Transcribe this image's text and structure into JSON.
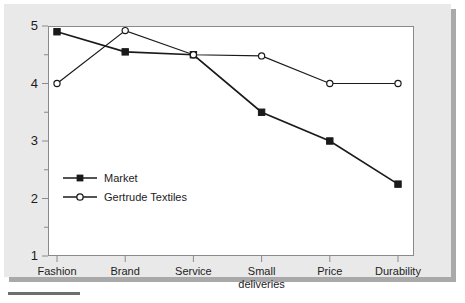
{
  "chart_data": {
    "type": "line",
    "title": "",
    "subtitle": "",
    "xlabel": "",
    "ylabel": "",
    "categories": [
      "Fashion",
      "Brand",
      "Service",
      "Small\ndeliveries",
      "Price",
      "Durability"
    ],
    "category_labels_flat": [
      "Fashion",
      "Brand",
      "Service",
      "Small deliveries",
      "Price",
      "Durability"
    ],
    "ylim": [
      1,
      5
    ],
    "ytick_labels": [
      "1",
      "2",
      "3",
      "4",
      "5"
    ],
    "ytick_values": [
      1,
      2,
      3,
      4,
      5
    ],
    "yminor_ticks": [
      1.5,
      2.5,
      3.5,
      4.5
    ],
    "grid": false,
    "legend_position": "inside-lower-left",
    "series": [
      {
        "name": "Market",
        "marker": "filled-square",
        "color": "#1a1a1a",
        "values": [
          4.9,
          4.55,
          4.5,
          3.5,
          3.0,
          2.25
        ]
      },
      {
        "name": "Gertrude Textiles",
        "marker": "open-circle",
        "color": "#1a1a1a",
        "values": [
          4.0,
          4.92,
          4.5,
          4.48,
          4.0,
          4.0
        ]
      }
    ]
  },
  "legend": {
    "items": [
      {
        "label": "Market",
        "marker": "filled-square-icon"
      },
      {
        "label": "Gertrude Textiles",
        "marker": "open-circle-icon"
      }
    ]
  },
  "style": {
    "panel_background": "#e9e9e9",
    "plot_background": "#ffffff",
    "line_color": "#1a1a1a",
    "axis_color": "#8a8a8a",
    "text_color": "#1c1c1c",
    "shadow_color": "#a9a9a9"
  }
}
